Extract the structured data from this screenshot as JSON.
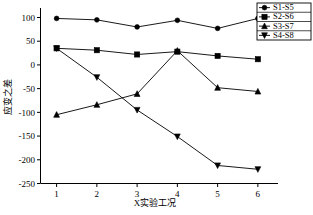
{
  "chart_data": {
    "type": "line",
    "title": "",
    "xlabel": "X实验工况",
    "ylabel": "应变之差",
    "x": [
      1,
      2,
      3,
      4,
      5,
      6
    ],
    "xticklabels": [
      "1",
      "2",
      "3",
      "4",
      "5",
      "6"
    ],
    "yticklabels": [
      "100",
      "50",
      "0",
      "-50",
      "-100",
      "-150",
      "-200",
      "-250"
    ],
    "yticks": [
      100,
      50,
      0,
      -50,
      -100,
      -150,
      -200,
      -250
    ],
    "ylim": [
      -250,
      120
    ],
    "xlim": [
      0.6,
      6.5
    ],
    "grid": false,
    "legend_position": "top-right",
    "series": [
      {
        "name": "S1-S5",
        "marker": "circle",
        "values": [
          98,
          95,
          80,
          94,
          77,
          98
        ]
      },
      {
        "name": "S2-S6",
        "marker": "square",
        "values": [
          35,
          31,
          22,
          28,
          19,
          12
        ]
      },
      {
        "name": "S3-S7",
        "marker": "triangle-up",
        "values": [
          -105,
          -84,
          -61,
          30,
          -48,
          -56
        ]
      },
      {
        "name": "S4-S8",
        "marker": "triangle-down",
        "values": [
          35,
          -26,
          -95,
          -151,
          -212,
          -220
        ]
      }
    ]
  },
  "legend": {
    "items": [
      {
        "label": "S1-S5"
      },
      {
        "label": "S2-S6"
      },
      {
        "label": "S3-S7"
      },
      {
        "label": "S4-S8"
      }
    ]
  },
  "colors": {
    "ink": "#000000",
    "paper": "#ffffff"
  }
}
